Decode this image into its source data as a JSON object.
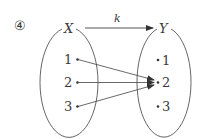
{
  "problem_number": "④",
  "mapping": {
    "name": "k",
    "domain_label": "X",
    "codomain_label": "Y"
  },
  "domain_elements": [
    "1",
    "2",
    "3"
  ],
  "codomain_elements": [
    "1",
    "2",
    "3"
  ],
  "arrows": [
    {
      "from": "1",
      "to": "2"
    },
    {
      "from": "2",
      "to": "2"
    },
    {
      "from": "3",
      "to": "2"
    }
  ],
  "colors": {
    "stroke": "#555555",
    "text": "#3a3a3a",
    "background": "#ffffff"
  }
}
